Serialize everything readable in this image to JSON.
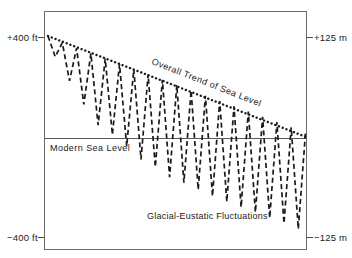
{
  "figure": {
    "name": "sea-level-curve",
    "background": "#ffffff",
    "ink": "#1a1a1a",
    "frame_color": "#6b6b6b"
  },
  "axes": {
    "top_left_label": "+400 ft",
    "top_right_label": "+125 m",
    "bottom_left_label": "−400 ft",
    "bottom_right_label": "−125 m"
  },
  "annotations": {
    "sea_level": "Modern Sea Level",
    "fluctuations": "Glacial-Eustatic Fluctuations",
    "trend": "Overall Trend of Sea Level"
  },
  "chart_data": {
    "type": "line",
    "title": "",
    "xlabel": "",
    "ylabel": "",
    "grid": false,
    "legend": "none",
    "axis_units": {
      "left": "ft",
      "right": "m"
    },
    "ylim_left": [
      -400,
      400
    ],
    "ylim_right": [
      -125,
      125
    ],
    "ytick_labels_left": [
      "+400 ft",
      "−400 ft"
    ],
    "ytick_labels_right": [
      "+125 m",
      "−125 m"
    ],
    "reference_lines": [
      {
        "name": "modern-sea-level",
        "label": "Modern Sea Level",
        "value_ft": 0,
        "value_m": 0,
        "style": "solid"
      }
    ],
    "series": [
      {
        "name": "Overall Trend of Sea Level",
        "style": "dotted",
        "x": [
          0,
          100
        ],
        "values_ft": [
          400,
          0
        ],
        "description": "Straight declining dotted line from +400 ft at left edge to 0 ft (modern sea level) at right edge"
      },
      {
        "name": "Glacial-Eustatic Fluctuations",
        "style": "dashed",
        "description": "Sawtooth oscillation whose peaks ride the declining trend line and whose troughs deepen progressively toward the right",
        "peaks_ft": [
          400,
          373,
          352,
          331,
          310,
          289,
          268,
          247,
          226,
          205,
          184,
          163,
          142,
          121,
          100,
          79,
          58,
          37,
          16
        ],
        "troughs_ft": [
          318,
          222,
          128,
          46,
          8,
          -38,
          -90,
          -120,
          -160,
          -182,
          -210,
          -236,
          -258,
          -280,
          -300,
          -322,
          -344,
          -366
        ]
      }
    ]
  }
}
